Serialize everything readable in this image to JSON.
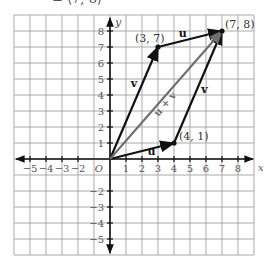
{
  "caption": "= ⟨7, 8⟩",
  "chart_data": {
    "type": "vector-diagram",
    "xlabel": "x",
    "ylabel": "y",
    "xlim": [
      -6,
      9
    ],
    "ylim": [
      -6,
      9
    ],
    "grid": true,
    "origin_label": "O",
    "x_ticks": [
      -5,
      -4,
      -3,
      -2,
      1,
      2,
      3,
      4,
      5,
      6,
      7,
      8
    ],
    "y_ticks": [
      -5,
      -4,
      -3,
      -2,
      1,
      2,
      3,
      4,
      5,
      6,
      7,
      8
    ],
    "tick_labels_x": [
      "−5",
      "−4",
      "−3",
      "−2",
      "1",
      "2",
      "3",
      "4",
      "5",
      "6",
      "7",
      "8"
    ],
    "tick_labels_y": [
      "−5",
      "−4",
      "−3",
      "−2",
      "1",
      "2",
      "3",
      "4",
      "5",
      "6",
      "7",
      "8"
    ],
    "vectors": [
      {
        "name": "v",
        "from": [
          0,
          0
        ],
        "to": [
          3,
          7
        ],
        "color": "#111111",
        "label": "v",
        "label_pos": [
          1.5,
          4.5
        ]
      },
      {
        "name": "u",
        "from": [
          3,
          7
        ],
        "to": [
          7,
          8
        ],
        "color": "#111111",
        "label": "u",
        "label_pos": [
          4.55,
          7.65
        ]
      },
      {
        "name": "u",
        "from": [
          0,
          0
        ],
        "to": [
          4,
          1
        ],
        "color": "#111111",
        "label": "u",
        "label_pos": [
          2.6,
          0.25
        ]
      },
      {
        "name": "v",
        "from": [
          4,
          1
        ],
        "to": [
          7,
          8
        ],
        "color": "#111111",
        "label": "v",
        "label_pos": [
          5.9,
          4.1
        ]
      },
      {
        "name": "u + v",
        "from": [
          0,
          0
        ],
        "to": [
          7,
          8
        ],
        "color": "#6e6e6e",
        "label": "u + v",
        "label_pos": [
          3.6,
          3.3
        ]
      }
    ],
    "points": [
      {
        "label": "(3, 7)",
        "x": 3,
        "y": 7,
        "label_dx": -23,
        "label_dy": -5
      },
      {
        "label": "(7, 8)",
        "x": 7,
        "y": 8,
        "label_dx": 3,
        "label_dy": -3
      },
      {
        "label": "(4, 1)",
        "x": 4,
        "y": 1,
        "label_dx": 5,
        "label_dy": -3
      }
    ]
  },
  "layout": {
    "origin_px": [
      110,
      159
    ],
    "cell_px": 16,
    "grid_color": "#a9a9a9",
    "axis_color": "#111111",
    "tick_label_color": "#555555"
  }
}
